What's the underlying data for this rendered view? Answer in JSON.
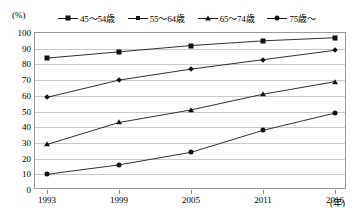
{
  "chart_data": {
    "type": "line",
    "title": "",
    "xlabel": "年",
    "ylabel": "(%)",
    "x": [
      1993,
      1999,
      2005,
      2011,
      2016
    ],
    "categories": [
      "1993",
      "1999",
      "2005",
      "2011",
      "2016"
    ],
    "ylim": [
      0,
      100
    ],
    "yticks": [
      0,
      10,
      20,
      30,
      40,
      50,
      60,
      70,
      80,
      90,
      100
    ],
    "grid": true,
    "legend_position": "top",
    "series": [
      {
        "name": "45～54歳",
        "marker": "square",
        "values": [
          84,
          88,
          92,
          95,
          97
        ]
      },
      {
        "name": "55～64歳",
        "marker": "diamond",
        "values": [
          59,
          70,
          77,
          83,
          89
        ]
      },
      {
        "name": "65～74歳",
        "marker": "triangle",
        "values": [
          29,
          43,
          51,
          61,
          69
        ]
      },
      {
        "name": "75歳～",
        "marker": "circle",
        "values": [
          10,
          16,
          24,
          38,
          49
        ]
      }
    ]
  },
  "axes": {
    "unit_label": "(%)",
    "x_unit_label": "(年)"
  },
  "colors": {
    "line": "#1a1a1a",
    "grid": "#c9c9c9",
    "frame": "#9a9a9a",
    "text": "#000000"
  }
}
